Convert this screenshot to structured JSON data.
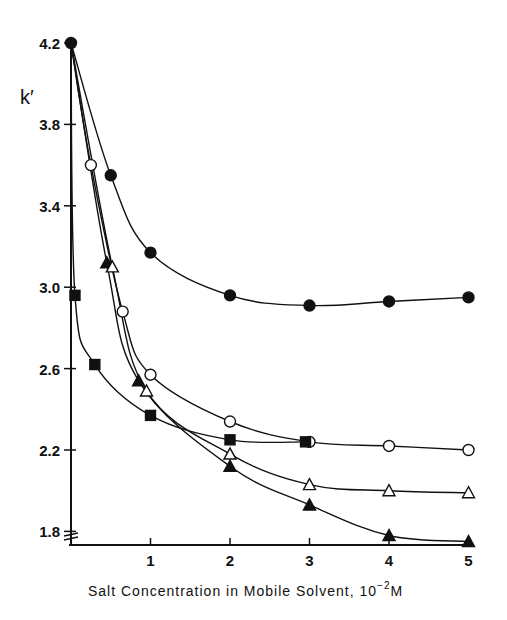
{
  "chart_data": {
    "type": "line",
    "title": "",
    "xlabel": "Salt Concentration in Mobile Solvent, 10^-2 M",
    "xlabel_main": "Salt Concentration in Mobile Solvent, 10",
    "xlabel_exp": "−2",
    "xlabel_unit": "M",
    "ylabel": "k′",
    "xlim": [
      0,
      5
    ],
    "ylim": [
      1.72,
      4.2
    ],
    "x_ticks": [
      1,
      2,
      3,
      4,
      5
    ],
    "y_ticks": [
      1.8,
      2.2,
      2.6,
      3.0,
      3.4,
      3.8,
      4.2
    ],
    "y_tick_labels": [
      "1.8",
      "2.2",
      "2.6",
      "3.0",
      "3.4",
      "3.8",
      "4.2"
    ],
    "axis_break": true,
    "grid": false,
    "legend": "none",
    "series": [
      {
        "name": "filled-circle",
        "marker": "circle",
        "filled": true,
        "points": [
          [
            0,
            4.2
          ],
          [
            0.5,
            3.55
          ],
          [
            1.0,
            3.17
          ],
          [
            2.0,
            2.96
          ],
          [
            3.0,
            2.91
          ],
          [
            4.0,
            2.93
          ],
          [
            5.0,
            2.95
          ]
        ]
      },
      {
        "name": "open-circle",
        "marker": "circle",
        "filled": false,
        "points": [
          [
            0,
            4.2
          ],
          [
            0.25,
            3.6
          ],
          [
            0.65,
            2.88
          ],
          [
            1.0,
            2.57
          ],
          [
            2.0,
            2.34
          ],
          [
            3.0,
            2.24
          ],
          [
            4.0,
            2.22
          ],
          [
            5.0,
            2.2
          ]
        ]
      },
      {
        "name": "filled-square",
        "marker": "square",
        "filled": true,
        "points": [
          [
            0,
            4.2
          ],
          [
            0.05,
            2.96
          ],
          [
            0.3,
            2.62
          ],
          [
            1.0,
            2.37
          ],
          [
            2.0,
            2.25
          ],
          [
            2.95,
            2.24
          ]
        ]
      },
      {
        "name": "filled-triangle",
        "marker": "triangle",
        "filled": true,
        "points": [
          [
            0,
            4.2
          ],
          [
            0.45,
            3.12
          ],
          [
            0.85,
            2.54
          ],
          [
            2.0,
            2.12
          ],
          [
            3.0,
            1.93
          ],
          [
            4.0,
            1.78
          ],
          [
            5.0,
            1.75
          ]
        ]
      },
      {
        "name": "open-triangle",
        "marker": "triangle",
        "filled": false,
        "points": [
          [
            0,
            4.2
          ],
          [
            0.52,
            3.1
          ],
          [
            0.95,
            2.49
          ],
          [
            2.0,
            2.18
          ],
          [
            3.0,
            2.03
          ],
          [
            4.0,
            2.0
          ],
          [
            5.0,
            1.99
          ]
        ]
      }
    ]
  }
}
